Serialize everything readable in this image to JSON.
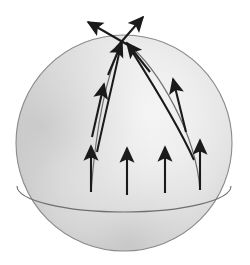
{
  "figure": {
    "background_color": "#ffffff",
    "canvas": {
      "width": 250,
      "height": 265
    }
  },
  "sphere": {
    "name": "shaded-sphere",
    "center": {
      "x": 124,
      "y": 143
    },
    "radius": 108,
    "outline_color": "#8a8a8a",
    "fill_light": "#f2f2f2",
    "fill_mid": "#d9d9d9",
    "fill_dark": "#b4b4b4",
    "highlight": {
      "x": 150,
      "y": 95
    }
  },
  "equator": {
    "name": "equator-arc",
    "center_x": 124,
    "center_y": 186,
    "rx": 107,
    "ry": 26,
    "stroke": "#6e6e6e",
    "stroke_width": 1.1
  },
  "meridians": [
    {
      "name": "left-meridian-arc",
      "path": "M 91 192 C 95 140, 104 80, 122 42",
      "stroke": "#6e6e6e",
      "stroke_width": 1.2
    },
    {
      "name": "right-meridian-arc",
      "path": "M 200 190 C 196 135, 160 70, 126 42",
      "stroke": "#6e6e6e",
      "stroke_width": 1.2
    }
  ],
  "vectors": {
    "stroke": "#1a1a1a",
    "equator_vectors": [
      {
        "name": "equator-vector-1",
        "x1": 91,
        "y1": 192,
        "x2": 91,
        "y2": 146
      },
      {
        "name": "equator-vector-2",
        "x1": 127,
        "y1": 195,
        "x2": 127,
        "y2": 148
      },
      {
        "name": "equator-vector-3",
        "x1": 165,
        "y1": 193,
        "x2": 165,
        "y2": 147
      },
      {
        "name": "equator-vector-4",
        "x1": 200,
        "y1": 190,
        "x2": 200,
        "y2": 140
      }
    ],
    "transported_vectors": [
      {
        "name": "left-mid-vector",
        "x1": 92,
        "y1": 137,
        "x2": 104,
        "y2": 84
      },
      {
        "name": "right-mid-vector",
        "x1": 186,
        "y1": 132,
        "x2": 173,
        "y2": 79
      }
    ],
    "pole_vectors": [
      {
        "name": "pole-vector-left-incoming",
        "x1": 108,
        "y1": 75,
        "x2": 122,
        "y2": 42
      },
      {
        "name": "pole-vector-right-incoming",
        "x1": 150,
        "y1": 72,
        "x2": 127,
        "y2": 43
      },
      {
        "name": "pole-vector-up-left",
        "x1": 128,
        "y1": 45,
        "x2": 88,
        "y2": 22
      },
      {
        "name": "pole-vector-up-right",
        "x1": 116,
        "y1": 48,
        "x2": 143,
        "y2": 17
      }
    ],
    "arrowhead": {
      "length": 11,
      "half_width": 4.2
    }
  },
  "labels": {
    "diagram_name": "parallel-transport-sphere",
    "description": "Two geodesic arcs rise from the equator and meet at the pole; tangent arrows transported along each arc arrive at the pole pointing in different directions, illustrating holonomy."
  }
}
